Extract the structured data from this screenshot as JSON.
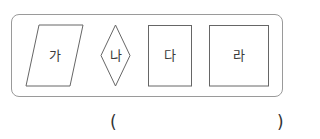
{
  "figure": {
    "shapes": [
      {
        "id": "ga",
        "label": "가",
        "type": "parallelogram"
      },
      {
        "id": "na",
        "label": "나",
        "type": "rhombus"
      },
      {
        "id": "da",
        "label": "다",
        "type": "rectangle"
      },
      {
        "id": "ra",
        "label": "라",
        "type": "square"
      }
    ],
    "stroke_color": "#666666",
    "frame_color": "#9a9a9a"
  },
  "answer": {
    "open_paren": "(",
    "close_paren": ")",
    "value": ""
  }
}
